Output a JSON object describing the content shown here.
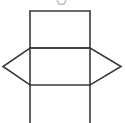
{
  "figure": {
    "canvas": {
      "width": 125,
      "height": 123,
      "background_color": "#ffffff"
    },
    "style": {
      "stroke_color": "#3a3a3a",
      "stroke_width": 1.6,
      "fill_color": "none"
    },
    "geometry": {
      "left_x": 30,
      "right_x": 90,
      "top_y": 11,
      "upper_mid_y": 48,
      "lower_mid_y": 85,
      "bottom_y": 123,
      "left_vertex_x": 3,
      "right_vertex_x": 121,
      "vertex_y": 66.5
    },
    "shapes": [
      {
        "name": "top-rectangle",
        "kind": "rectangle",
        "points": "30,11 90,11 90,48 30,48"
      },
      {
        "name": "center-rectangle",
        "kind": "rectangle",
        "points": "30,48 90,48 90,85 30,85"
      },
      {
        "name": "left-triangle-flap",
        "kind": "triangle",
        "points": "30,48 3,66.5 30,85"
      },
      {
        "name": "right-triangle-flap",
        "kind": "triangle",
        "points": "90,48 121,66.5 90,85"
      },
      {
        "name": "left-bottom-edge",
        "kind": "line",
        "points": "30,85 30,123"
      },
      {
        "name": "right-bottom-edge",
        "kind": "line",
        "points": "90,85 90,123"
      }
    ],
    "top_artifact": {
      "name": "cropped-glyph-artifact",
      "x": 57,
      "y": 0,
      "width": 9,
      "height": 5,
      "color": "#8c8c8c"
    }
  }
}
